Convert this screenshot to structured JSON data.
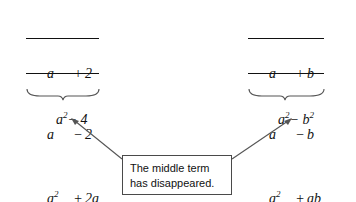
{
  "figure": {
    "caption_box": {
      "line1": "The middle term",
      "line2": "has disappeared."
    }
  },
  "problems": [
    {
      "id": "left",
      "multiplicand": {
        "lead": "a",
        "op": "+",
        "val": "2"
      },
      "multiplier": {
        "lead": "a",
        "op": "−",
        "val": "2"
      },
      "partial1": {
        "lead": "a",
        "lead_sup": "2",
        "op": "+",
        "val": "2a"
      },
      "partial2": {
        "lead": "",
        "op": "−",
        "val": "2a",
        "op2": "−",
        "val2": "4"
      },
      "sum": {
        "lead": "a",
        "lead_sup": "2",
        "op": "+",
        "val": "0",
        "op2": "−",
        "val2": "4"
      },
      "answer": {
        "base": "a",
        "sup": "2",
        "op": "−",
        "term": "4",
        "term_sup": ""
      }
    },
    {
      "id": "right",
      "multiplicand": {
        "lead": "a",
        "op": "+",
        "val": "b"
      },
      "multiplier": {
        "lead": "a",
        "op": "−",
        "val": "b"
      },
      "partial1": {
        "lead": "a",
        "lead_sup": "2",
        "op": "+",
        "val": "ab"
      },
      "partial2": {
        "lead": "",
        "op": "−",
        "val": "ab",
        "op2": "−",
        "val2": "b",
        "val2_sup": "2"
      },
      "sum": {
        "lead": "a",
        "lead_sup": "2",
        "op": "+",
        "val": "0",
        "op2": "−",
        "val2": "b",
        "val2_sup": "2"
      },
      "answer": {
        "base": "a",
        "sup": "2",
        "op": "−",
        "term": "b",
        "term_sup": "2"
      }
    }
  ],
  "colors": {
    "ink": "#111111",
    "box_border": "#4a4a4a",
    "background": "#ffffff",
    "arrow": "#555555",
    "brace": "#555555"
  }
}
